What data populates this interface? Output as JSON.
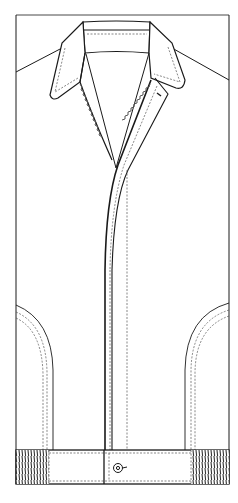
{
  "diagram": {
    "type": "technical-flat-sketch",
    "colors": {
      "line": "#1a1a1a",
      "stitch": "#555555",
      "fill": "#ffffff",
      "rib": "#333333"
    },
    "parts": [
      {
        "id": "body",
        "label": ""
      },
      {
        "id": "collar",
        "label": ""
      },
      {
        "id": "collar-stand",
        "label": ""
      },
      {
        "id": "placket",
        "label": ""
      },
      {
        "id": "left-pocket",
        "label": ""
      },
      {
        "id": "right-pocket",
        "label": ""
      },
      {
        "id": "waistband",
        "label": ""
      },
      {
        "id": "left-rib-cuff",
        "label": ""
      },
      {
        "id": "right-rib-cuff",
        "label": ""
      },
      {
        "id": "waistband-button",
        "label": ""
      }
    ]
  }
}
